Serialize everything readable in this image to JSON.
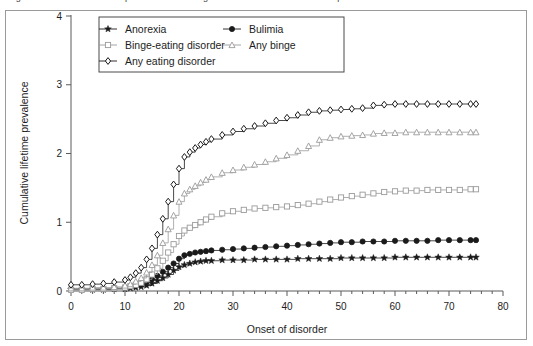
{
  "figure": {
    "caption": "Figure 1 Cumulative lifetime prevalence of eating disorders in a Finnish twin sample",
    "caption_visible": false
  },
  "chart_data": {
    "type": "line",
    "title": "",
    "subtitle": "",
    "xlabel": "Onset of disorder",
    "ylabel": "Cumulative lifetime prevalence",
    "xlim": [
      0,
      80
    ],
    "ylim": [
      0,
      4
    ],
    "xticks": [
      0,
      10,
      20,
      30,
      40,
      50,
      60,
      70,
      80
    ],
    "xtick_labels": [
      "0",
      "10",
      "20",
      "30",
      "40",
      "50",
      "60",
      "70",
      "80"
    ],
    "yticks": [
      0,
      1,
      2,
      3,
      4
    ],
    "ytick_labels": [
      "0",
      "1",
      "2",
      "3",
      "4"
    ],
    "x_minor_tick_interval": 2,
    "grid": false,
    "step_style": "post",
    "legend": {
      "position": "top-left-inside",
      "columns": 2,
      "border": true
    },
    "series": [
      {
        "name": "Anorexia",
        "marker": "star",
        "color": "#1a1a1a",
        "fill": "#1a1a1a",
        "legend_column": 0,
        "legend_row": 0,
        "x": [
          0,
          2,
          4,
          6,
          8,
          10,
          11,
          12,
          13,
          14,
          15,
          16,
          17,
          18,
          19,
          20,
          21,
          22,
          23,
          24,
          25,
          26,
          28,
          30,
          32,
          34,
          36,
          38,
          40,
          42,
          44,
          46,
          48,
          50,
          52,
          54,
          56,
          58,
          60,
          62,
          64,
          66,
          68,
          70,
          72,
          74,
          75
        ],
        "values": [
          0.02,
          0.02,
          0.02,
          0.02,
          0.03,
          0.03,
          0.04,
          0.05,
          0.06,
          0.08,
          0.11,
          0.15,
          0.19,
          0.24,
          0.3,
          0.35,
          0.38,
          0.4,
          0.42,
          0.43,
          0.44,
          0.44,
          0.45,
          0.45,
          0.45,
          0.46,
          0.46,
          0.46,
          0.46,
          0.47,
          0.47,
          0.47,
          0.47,
          0.48,
          0.48,
          0.48,
          0.48,
          0.48,
          0.49,
          0.49,
          0.49,
          0.49,
          0.49,
          0.49,
          0.49,
          0.49,
          0.49
        ]
      },
      {
        "name": "Bulimia",
        "marker": "circle-filled",
        "color": "#1a1a1a",
        "fill": "#1a1a1a",
        "legend_column": 1,
        "legend_row": 0,
        "x": [
          0,
          2,
          4,
          6,
          8,
          10,
          11,
          12,
          13,
          14,
          15,
          16,
          17,
          18,
          19,
          20,
          21,
          22,
          23,
          24,
          25,
          26,
          28,
          30,
          32,
          34,
          36,
          38,
          40,
          42,
          44,
          46,
          48,
          50,
          52,
          54,
          56,
          58,
          60,
          62,
          64,
          66,
          68,
          70,
          72,
          74,
          75
        ],
        "values": [
          0.03,
          0.03,
          0.03,
          0.03,
          0.04,
          0.05,
          0.06,
          0.08,
          0.1,
          0.13,
          0.17,
          0.22,
          0.28,
          0.34,
          0.4,
          0.47,
          0.52,
          0.54,
          0.56,
          0.57,
          0.58,
          0.59,
          0.6,
          0.61,
          0.62,
          0.63,
          0.64,
          0.65,
          0.66,
          0.67,
          0.68,
          0.69,
          0.7,
          0.71,
          0.71,
          0.72,
          0.72,
          0.72,
          0.73,
          0.73,
          0.73,
          0.73,
          0.74,
          0.74,
          0.74,
          0.74,
          0.74
        ]
      },
      {
        "name": "Binge-eating disorder",
        "marker": "square-open",
        "color": "#9a9a9a",
        "fill": "#ffffff",
        "legend_column": 0,
        "legend_row": 1,
        "x": [
          0,
          2,
          4,
          6,
          8,
          10,
          11,
          12,
          13,
          14,
          15,
          16,
          17,
          18,
          19,
          20,
          21,
          22,
          23,
          24,
          25,
          26,
          28,
          30,
          32,
          34,
          36,
          38,
          40,
          42,
          44,
          46,
          48,
          50,
          52,
          54,
          56,
          58,
          60,
          62,
          64,
          66,
          68,
          70,
          72,
          74,
          75
        ],
        "values": [
          0.02,
          0.02,
          0.03,
          0.03,
          0.04,
          0.05,
          0.07,
          0.09,
          0.12,
          0.17,
          0.24,
          0.33,
          0.44,
          0.56,
          0.68,
          0.8,
          0.88,
          0.92,
          0.96,
          1.0,
          1.04,
          1.08,
          1.13,
          1.16,
          1.18,
          1.2,
          1.21,
          1.22,
          1.23,
          1.25,
          1.27,
          1.3,
          1.33,
          1.36,
          1.38,
          1.4,
          1.42,
          1.44,
          1.45,
          1.46,
          1.46,
          1.47,
          1.47,
          1.47,
          1.47,
          1.48,
          1.48
        ]
      },
      {
        "name": "Any binge",
        "marker": "triangle-open",
        "color": "#9a9a9a",
        "fill": "#ffffff",
        "legend_column": 1,
        "legend_row": 1,
        "x": [
          0,
          2,
          4,
          6,
          8,
          10,
          11,
          12,
          13,
          14,
          15,
          16,
          17,
          18,
          19,
          20,
          21,
          22,
          23,
          24,
          25,
          26,
          28,
          30,
          32,
          34,
          36,
          38,
          40,
          42,
          44,
          46,
          48,
          50,
          52,
          54,
          56,
          58,
          60,
          62,
          64,
          66,
          68,
          70,
          72,
          74,
          75
        ],
        "values": [
          0.04,
          0.04,
          0.05,
          0.05,
          0.06,
          0.08,
          0.1,
          0.14,
          0.19,
          0.27,
          0.38,
          0.52,
          0.7,
          0.9,
          1.1,
          1.3,
          1.42,
          1.48,
          1.53,
          1.58,
          1.62,
          1.66,
          1.72,
          1.76,
          1.8,
          1.84,
          1.88,
          1.93,
          1.98,
          2.04,
          2.11,
          2.2,
          2.23,
          2.25,
          2.26,
          2.27,
          2.29,
          2.3,
          2.3,
          2.31,
          2.31,
          2.31,
          2.31,
          2.31,
          2.31,
          2.31,
          2.31
        ]
      },
      {
        "name": "Any eating disorder",
        "marker": "diamond-open",
        "color": "#1a1a1a",
        "fill": "#ffffff",
        "legend_column": 0,
        "legend_row": 2,
        "x": [
          0,
          2,
          4,
          6,
          8,
          10,
          11,
          12,
          13,
          14,
          15,
          16,
          17,
          18,
          19,
          20,
          21,
          22,
          23,
          24,
          25,
          26,
          28,
          30,
          32,
          34,
          36,
          38,
          40,
          42,
          44,
          46,
          48,
          50,
          52,
          54,
          56,
          58,
          60,
          62,
          64,
          66,
          68,
          70,
          72,
          74,
          75
        ],
        "values": [
          0.09,
          0.09,
          0.1,
          0.11,
          0.13,
          0.16,
          0.2,
          0.26,
          0.34,
          0.46,
          0.62,
          0.82,
          1.05,
          1.3,
          1.55,
          1.78,
          1.95,
          2.02,
          2.08,
          2.13,
          2.17,
          2.21,
          2.27,
          2.32,
          2.36,
          2.4,
          2.44,
          2.48,
          2.52,
          2.56,
          2.6,
          2.62,
          2.63,
          2.64,
          2.65,
          2.66,
          2.7,
          2.71,
          2.72,
          2.72,
          2.72,
          2.72,
          2.72,
          2.72,
          2.72,
          2.72,
          2.72
        ]
      }
    ]
  }
}
